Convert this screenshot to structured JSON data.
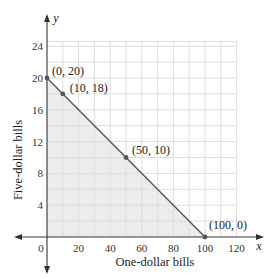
{
  "chart_data": {
    "type": "line",
    "title": "",
    "xlabel": "One-dollar bills",
    "ylabel": "Five-dollar bills",
    "x_axis_var": "x",
    "y_axis_var": "y",
    "xlim": [
      0,
      120
    ],
    "ylim": [
      0,
      24
    ],
    "xticks": [
      0,
      20,
      40,
      60,
      80,
      100,
      120
    ],
    "yticks": [
      4,
      8,
      12,
      16,
      20,
      24
    ],
    "grid": true,
    "grid_minor_x_step": 10,
    "grid_minor_y_step": 2,
    "series": [
      {
        "name": "x + 5y = 100",
        "x": [
          0,
          100
        ],
        "y": [
          20,
          0
        ],
        "shaded_region": "below line, first quadrant"
      }
    ],
    "points": [
      {
        "x": 0,
        "y": 20,
        "label": "(0, 20)"
      },
      {
        "x": 10,
        "y": 18,
        "label": "(10, 18)"
      },
      {
        "x": 50,
        "y": 10,
        "label": "(50, 10)"
      },
      {
        "x": 100,
        "y": 0,
        "label": "(100, 0)"
      }
    ],
    "colors": {
      "line": "#555555",
      "shade": "#ececec",
      "grid": "#dedede",
      "axis": "#333333",
      "point": "#555555"
    }
  }
}
